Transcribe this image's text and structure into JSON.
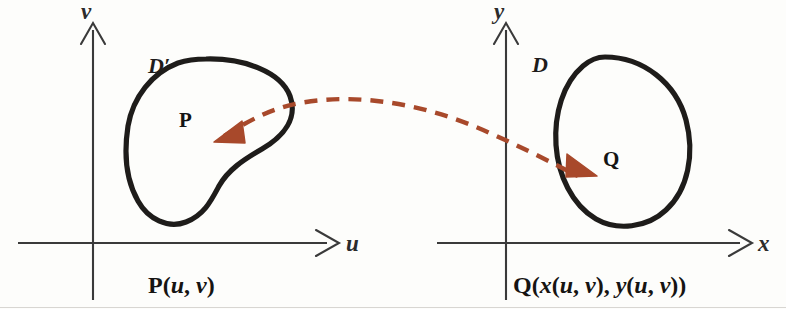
{
  "figure": {
    "background_color": "#fdfdfb",
    "curve_color": "#1e1c1a",
    "axis_color": "#3a3a3a",
    "arrow_color": "#a8492b"
  },
  "left_panel": {
    "name": "uv-plane",
    "axis_x_label": "u",
    "axis_y_label": "v",
    "region_label": "D′",
    "point_label": "P",
    "caption": {
      "full": "P(u, v)",
      "func": "P",
      "open": "(",
      "arg1": "u",
      "comma": ", ",
      "arg2": "v",
      "close": ")"
    }
  },
  "right_panel": {
    "name": "xy-plane",
    "axis_x_label": "x",
    "axis_y_label": "y",
    "region_label": "D",
    "point_label": "Q",
    "caption": {
      "full": "Q(x(u, v), y(u, v))",
      "func": "Q",
      "open": "(",
      "arg1": "x",
      "inner_open1": "(",
      "inner_a1": "u",
      "inner_comma1": ", ",
      "inner_b1": "v",
      "inner_close1": ")",
      "comma": ", ",
      "arg2": "y",
      "inner_open2": "(",
      "inner_a2": "u",
      "inner_comma2": ", ",
      "inner_b2": "v",
      "inner_close2": ")",
      "close": ")"
    }
  },
  "mapping_arrow": {
    "name": "transformation-arrow",
    "style": "dashed",
    "color": "#a8492b",
    "direction": "bidirectional",
    "left_head": "arrow pointing left into D′ at P",
    "right_head": "arrow pointing right into D at Q"
  },
  "icons": {
    "axis_arrowhead": "arrowhead-icon",
    "dashed_curve": "dashed-curve-icon",
    "blob_left": "region-outline-icon",
    "blob_right": "region-outline-icon"
  }
}
